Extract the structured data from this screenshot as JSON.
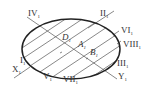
{
  "diagram": {
    "type": "section-ellipse-with-hatching",
    "colors": {
      "outline": "#222222",
      "lines": "#555555",
      "text": "#333333",
      "background": "#ffffff"
    },
    "ellipse": {
      "cx": 71,
      "cy": 49,
      "rx": 49,
      "ry": 30
    },
    "axis_line": {
      "from": "X1",
      "to": "Y1"
    },
    "labels": [
      {
        "id": "IV",
        "text": "IV",
        "sub": "1",
        "x": 30,
        "y": 17
      },
      {
        "id": "II",
        "text": "II",
        "sub": "1",
        "x": 100,
        "y": 17
      },
      {
        "id": "VI",
        "text": "VI",
        "sub": "1",
        "x": 120,
        "y": 35
      },
      {
        "id": "VIII",
        "text": "VIII",
        "sub": "1",
        "x": 123,
        "y": 47
      },
      {
        "id": "III",
        "text": "III",
        "sub": "1",
        "x": 118,
        "y": 66
      },
      {
        "id": "Y",
        "text": "Y",
        "sub": "1",
        "x": 118,
        "y": 79
      },
      {
        "id": "I",
        "text": "I",
        "sub": "1",
        "x": 20,
        "y": 63
      },
      {
        "id": "X",
        "text": "X",
        "sub": "1",
        "x": 13,
        "y": 71
      },
      {
        "id": "V",
        "text": "V",
        "sub": "1",
        "x": 43,
        "y": 78
      },
      {
        "id": "VII",
        "text": "VII",
        "sub": "1",
        "x": 64,
        "y": 81
      },
      {
        "id": "D",
        "text": "D",
        "sub": "1",
        "x": 62,
        "y": 40
      },
      {
        "id": "A",
        "text": "A",
        "sub": "1",
        "x": 78,
        "y": 47
      },
      {
        "id": "B",
        "text": "B",
        "sub": "1",
        "x": 90,
        "y": 55
      }
    ]
  }
}
